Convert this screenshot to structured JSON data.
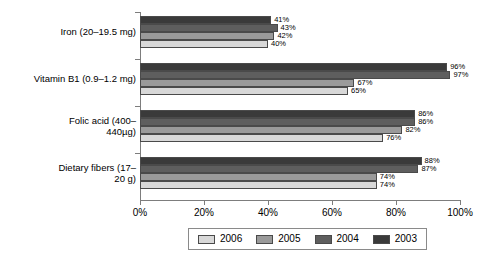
{
  "chart_data": {
    "type": "bar",
    "orientation": "horizontal",
    "title": "",
    "subtitle": "",
    "xlabel": "",
    "ylabel": "",
    "xlim": [
      0,
      100
    ],
    "xtick_labels": [
      "0%",
      "20%",
      "40%",
      "60%",
      "80%",
      "100%"
    ],
    "xtick_values": [
      0,
      20,
      40,
      60,
      80,
      100
    ],
    "grid": false,
    "legend_position": "bottom",
    "value_label_suffix": "%",
    "categories": [
      "Iron (20–19.5 mg)",
      "Vitamin B1 (0.9–1.2 mg)",
      "Folic acid (400–440µg)",
      "Dietary fibers (17–20 g)"
    ],
    "category_lines": [
      [
        "Iron (20–19.5 mg)"
      ],
      [
        "Vitamin B1 (0.9–1.2 mg)"
      ],
      [
        "Folic acid (400–",
        "440µg)"
      ],
      [
        "Dietary fibers (17–",
        "20 g)"
      ]
    ],
    "series": [
      {
        "name": "2003",
        "color": "#3a3a3a",
        "values": [
          41,
          96,
          86,
          88
        ],
        "labels": [
          "41%",
          "96%",
          "86%",
          "88%"
        ]
      },
      {
        "name": "2004",
        "color": "#5e5e5e",
        "values": [
          43,
          97,
          86,
          87
        ],
        "labels": [
          "43%",
          "97%",
          "86%",
          "87%"
        ]
      },
      {
        "name": "2005",
        "color": "#9a9a9a",
        "values": [
          42,
          67,
          82,
          74
        ],
        "labels": [
          "42%",
          "67%",
          "82%",
          "74%"
        ]
      },
      {
        "name": "2006",
        "color": "#d8d8d8",
        "values": [
          40,
          65,
          76,
          74
        ],
        "labels": [
          "40%",
          "65%",
          "76%",
          "74%"
        ]
      }
    ],
    "legend": [
      {
        "label": "2006",
        "color": "#d8d8d8"
      },
      {
        "label": "2005",
        "color": "#9a9a9a"
      },
      {
        "label": "2004",
        "color": "#5e5e5e"
      },
      {
        "label": "2003",
        "color": "#3a3a3a"
      }
    ]
  }
}
